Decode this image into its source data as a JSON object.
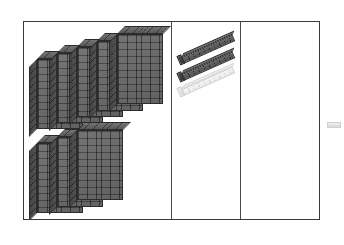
{
  "workspace": {
    "title": "Base Ten Blocks Workspace",
    "background_color": "#ffffff",
    "board_border_color": "#3a3a3a",
    "divider_color": "#4a4a4a"
  },
  "columns": [
    {
      "id": "hundreds",
      "name": "hundreds-column",
      "place_value": "100",
      "block_type": "flat",
      "block_count": 8,
      "block_color": "#4c4c4c",
      "groups": [
        {
          "name": "upper-row",
          "count": 5
        },
        {
          "name": "lower-row",
          "count": 3
        }
      ]
    },
    {
      "id": "tens",
      "name": "tens-column",
      "place_value": "10",
      "block_type": "rod",
      "block_count": 3,
      "block_color": "#4a4a4a",
      "groups": [
        {
          "name": "rod-stack",
          "count": 3,
          "solid": 2,
          "ghost": 1
        }
      ]
    },
    {
      "id": "ones",
      "name": "ones-column",
      "place_value": "1",
      "block_type": "unit",
      "block_count": 0,
      "block_color": "#e0e0e0",
      "groups": []
    }
  ],
  "hundreds_flats": {
    "upper": [
      {
        "label": "flat-1",
        "x": 0,
        "y": 26
      },
      {
        "label": "flat-2",
        "x": 20,
        "y": 20
      },
      {
        "label": "flat-3",
        "x": 40,
        "y": 14
      },
      {
        "label": "flat-4",
        "x": 60,
        "y": 8
      },
      {
        "label": "flat-5",
        "x": 80,
        "y": 1
      }
    ],
    "lower": [
      {
        "label": "flat-6",
        "x": 0,
        "y": 14
      },
      {
        "label": "flat-7",
        "x": 20,
        "y": 8
      },
      {
        "label": "flat-8",
        "x": 40,
        "y": 1
      }
    ]
  },
  "tens_rods": [
    {
      "label": "rod-1",
      "x": 2,
      "y": 28,
      "style": "solid"
    },
    {
      "label": "rod-2",
      "x": 2,
      "y": 45,
      "style": "solid"
    },
    {
      "label": "rod-3",
      "x": 2,
      "y": 60,
      "style": "ghost"
    }
  ],
  "stray_marker": {
    "name": "stray-unit-marker",
    "color": "#e4e4e4"
  }
}
